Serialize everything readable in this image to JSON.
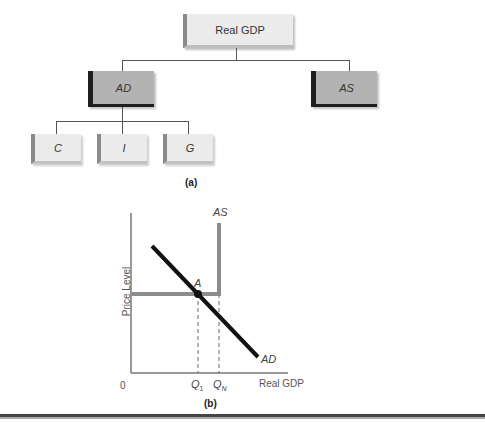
{
  "tree": {
    "root": {
      "label": "Real GDP"
    },
    "level1": [
      {
        "label": "AD"
      },
      {
        "label": "AS"
      }
    ],
    "level2": [
      {
        "label": "C"
      },
      {
        "label": "I"
      },
      {
        "label": "G"
      }
    ],
    "caption": "(a)"
  },
  "graph": {
    "ylabel": "Price Level",
    "xlabel": "Real GDP",
    "origin": "0",
    "as_label": "AS",
    "ad_label": "AD",
    "point_label": "A",
    "q1_main": "Q",
    "q1_sub": "1",
    "qn_main": "Q",
    "qn_sub": "N",
    "caption": "(b)"
  },
  "colors": {
    "as_curve": "#8c8c8c",
    "ad_curve": "#111111",
    "dark_box": "#b3b3b3",
    "light_box": "#ebebeb"
  }
}
